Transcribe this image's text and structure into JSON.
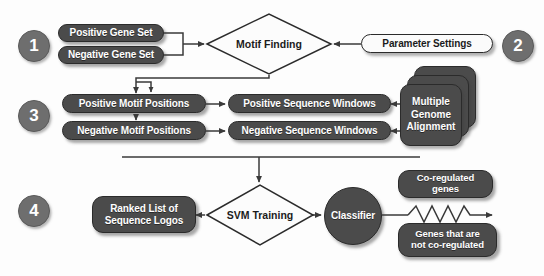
{
  "diagram": {
    "colors": {
      "node_fill_dark": "#4b4b4b",
      "node_fill_light": "#fbfbfb",
      "node_stroke": "#2b2b2b",
      "badge_fill": "#6e6e6e",
      "connector": "#3a3a3a",
      "background": "#fdfdfd",
      "text_on_dark": "#ffffff",
      "text_on_light": "#1b1b1b"
    },
    "steps": [
      {
        "id": "step-1",
        "number": "1"
      },
      {
        "id": "step-2",
        "number": "2"
      },
      {
        "id": "step-3",
        "number": "3"
      },
      {
        "id": "step-4",
        "number": "4"
      }
    ],
    "nodes": {
      "positive_gene_set": "Positive Gene Set",
      "negative_gene_set": "Negative Gene Set",
      "motif_finding": "Motif Finding",
      "parameter_settings": "Parameter Settings",
      "positive_motif_positions": "Positive Motif Positions",
      "negative_motif_positions": "Negative Motif Positions",
      "positive_sequence_windows": "Positive Sequence Windows",
      "negative_sequence_windows": "Negative Sequence Windows",
      "multiple_genome_alignment": "Multiple\nGenome\nAlignment",
      "multiple_genome_alignment_lines": [
        "Multiple",
        "Genome",
        "Alignment"
      ],
      "ranked_list": "Ranked List of\nSequence Logos",
      "ranked_list_lines": [
        "Ranked List of",
        "Sequence Logos"
      ],
      "svm_training": "SVM Training",
      "classifier": "Classifier",
      "co_regulated_genes": "Co-regulated\ngenes",
      "co_regulated_genes_lines": [
        "Co-regulated",
        "genes"
      ],
      "not_co_regulated_genes": "Genes that are\nnot co-regulated",
      "not_co_regulated_genes_lines": [
        "Genes that are",
        "not co-regulated"
      ]
    }
  }
}
